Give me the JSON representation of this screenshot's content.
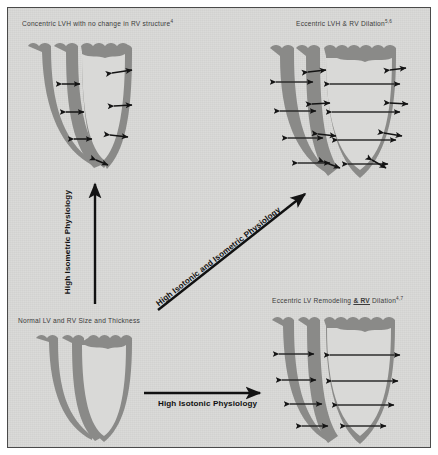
{
  "figure": {
    "title_alt": "Cardiac remodeling pathways in athletes",
    "background_color": "#d9d9d7",
    "border_color": "#4a4a4a",
    "wall_color": "#8a8a88",
    "arrow_color": "#151515"
  },
  "panels": {
    "top_left": {
      "caption": "Concentric LVH with no  change  in RV structure",
      "superscript": "4",
      "wall_state": "thickened",
      "chamber_state": "normal",
      "arrow_type": "wall-thickness"
    },
    "top_right": {
      "caption": "Eccentric LVH & RV Dilation",
      "superscript": "5,6",
      "wall_state": "thickened",
      "chamber_state": "dilated",
      "arrow_type": "wall-thickness-and-chamber-width"
    },
    "bottom_left": {
      "caption": "Normal LV and RV Size and Thickness",
      "superscript": "",
      "wall_state": "normal",
      "chamber_state": "normal",
      "arrow_type": "none"
    },
    "bottom_right": {
      "caption_a": "Eccentric LV Remodeling ",
      "caption_b": "& RV",
      "caption_c": " Dilation",
      "superscript": "4,7",
      "wall_state": "normal",
      "chamber_state": "dilated",
      "arrow_type": "chamber-width"
    }
  },
  "transitions": {
    "vertical": {
      "label": "High Isometric Physiology",
      "from": "bottom_left",
      "to": "top_left",
      "direction": "up"
    },
    "diagonal": {
      "label": "High Isotonic and Isometric Physiology",
      "from": "bottom_left",
      "to": "top_right",
      "direction": "up-right"
    },
    "horizontal": {
      "label": "High Isotonic Physiology",
      "from": "bottom_left",
      "to": "bottom_right",
      "direction": "right"
    }
  }
}
